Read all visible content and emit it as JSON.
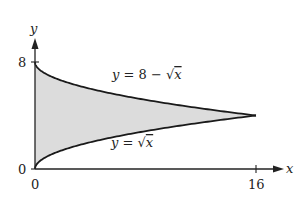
{
  "chart_data": {
    "type": "area",
    "title": "",
    "xlabel": "x",
    "ylabel": "y",
    "xlim": [
      0,
      16
    ],
    "ylim": [
      0,
      8
    ],
    "x_ticks": [
      "0",
      "16"
    ],
    "y_ticks": [
      "0",
      "8"
    ],
    "series": [
      {
        "name": "y = 8 − √x",
        "x": [
          0,
          1,
          4,
          9,
          16
        ],
        "values": [
          8,
          7,
          6,
          5,
          4
        ]
      },
      {
        "name": "y = √x",
        "x": [
          0,
          1,
          4,
          9,
          16
        ],
        "values": [
          0,
          1,
          2,
          3,
          4
        ]
      }
    ],
    "shaded_region": "between y = √x and y = 8 − √x for 0 ≤ x ≤ 16",
    "grid": false,
    "legend": "none (curves labeled inline)"
  },
  "labels": {
    "axis_x": "x",
    "axis_y": "y",
    "tick_x0": "0",
    "tick_x16": "16",
    "tick_y0": "0",
    "tick_y8": "8",
    "upper_prefix": "y = 8 − ",
    "lower_prefix": "y = ",
    "sqrt_sign": "√",
    "sqrt_arg": "x"
  },
  "colors": {
    "fill": "#dcdcdc",
    "curve": "#1a1a1a",
    "axis": "#222222"
  }
}
